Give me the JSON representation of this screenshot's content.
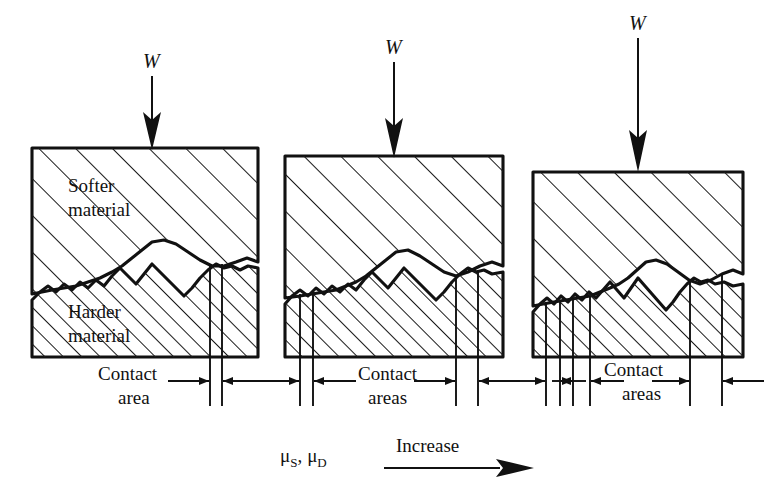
{
  "figure": {
    "title_implicit": "Effect of increasing contact area on friction coefficients",
    "background_color": "#ffffff",
    "ink_color": "#111111"
  },
  "panels": [
    {
      "id": "panel-left",
      "load_label": "W",
      "upper_block_label_line1": "Softer",
      "upper_block_label_line2": "material",
      "lower_block_label_line1": "Harder",
      "lower_block_label_line2": "material",
      "dimension_label_line1": "Contact",
      "dimension_label_line2": "area",
      "contact_zone_count": 1
    },
    {
      "id": "panel-middle",
      "load_label": "W",
      "upper_block_label_line1": "",
      "upper_block_label_line2": "",
      "lower_block_label_line1": "",
      "lower_block_label_line2": "",
      "dimension_label_line1": "Contact",
      "dimension_label_line2": "areas",
      "contact_zone_count": 2
    },
    {
      "id": "panel-right",
      "load_label": "W",
      "upper_block_label_line1": "",
      "upper_block_label_line2": "",
      "lower_block_label_line1": "",
      "lower_block_label_line2": "",
      "dimension_label_line1": "Contact",
      "dimension_label_line2": "areas",
      "contact_zone_count": 4
    }
  ],
  "caption": {
    "mu_symbol": "μ",
    "mu_static_sub": "S",
    "mu_dynamic_sub": "D",
    "mu_separator": ",",
    "direction_label": "Increase"
  }
}
